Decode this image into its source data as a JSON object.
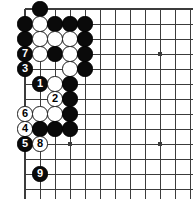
{
  "figure": {
    "board": {
      "type": "go-board",
      "visible_region": "upper-left corner partial board",
      "line_color": "#3c3c3c",
      "background_color": "#ffffff",
      "black_stone_color": "#0a0a0a",
      "white_stone_color": "#ffffff",
      "origin_x": 25,
      "origin_y": 9,
      "spacing": 15,
      "cols": 12,
      "rows": 13,
      "edge_left": true,
      "edge_top": true,
      "stone_radius": 7.6,
      "star_points": [
        {
          "col": 9,
          "row": 3
        },
        {
          "col": 9,
          "row": 9
        },
        {
          "col": 3,
          "row": 9
        }
      ]
    },
    "stones": [
      {
        "col": 1,
        "row": 0,
        "color": "black",
        "label": ""
      },
      {
        "col": 0,
        "row": 1,
        "color": "black",
        "label": ""
      },
      {
        "col": 1,
        "row": 1,
        "color": "white",
        "label": ""
      },
      {
        "col": 2,
        "row": 1,
        "color": "black",
        "label": ""
      },
      {
        "col": 3,
        "row": 1,
        "color": "black",
        "label": ""
      },
      {
        "col": 4,
        "row": 1,
        "color": "black",
        "label": ""
      },
      {
        "col": 0,
        "row": 2,
        "color": "black",
        "label": ""
      },
      {
        "col": 1,
        "row": 2,
        "color": "white",
        "label": ""
      },
      {
        "col": 2,
        "row": 2,
        "color": "white",
        "label": ""
      },
      {
        "col": 3,
        "row": 2,
        "color": "white",
        "label": ""
      },
      {
        "col": 4,
        "row": 2,
        "color": "black",
        "label": ""
      },
      {
        "col": 0,
        "row": 3,
        "color": "black",
        "label": "7"
      },
      {
        "col": 1,
        "row": 3,
        "color": "white",
        "label": ""
      },
      {
        "col": 2,
        "row": 3,
        "color": "black",
        "label": ""
      },
      {
        "col": 3,
        "row": 3,
        "color": "white",
        "label": ""
      },
      {
        "col": 4,
        "row": 3,
        "color": "black",
        "label": ""
      },
      {
        "col": 0,
        "row": 4,
        "color": "black",
        "label": "3"
      },
      {
        "col": 3,
        "row": 4,
        "color": "white",
        "label": ""
      },
      {
        "col": 4,
        "row": 4,
        "color": "black",
        "label": ""
      },
      {
        "col": 1,
        "row": 5,
        "color": "black",
        "label": "1"
      },
      {
        "col": 2,
        "row": 5,
        "color": "white",
        "label": ""
      },
      {
        "col": 3,
        "row": 5,
        "color": "black",
        "label": ""
      },
      {
        "col": 2,
        "row": 6,
        "color": "white",
        "label": "2"
      },
      {
        "col": 3,
        "row": 6,
        "color": "black",
        "label": ""
      },
      {
        "col": 0,
        "row": 7,
        "color": "white",
        "label": "6"
      },
      {
        "col": 1,
        "row": 7,
        "color": "white",
        "label": ""
      },
      {
        "col": 2,
        "row": 7,
        "color": "white",
        "label": ""
      },
      {
        "col": 3,
        "row": 7,
        "color": "black",
        "label": ""
      },
      {
        "col": 0,
        "row": 8,
        "color": "white",
        "label": "4"
      },
      {
        "col": 1,
        "row": 8,
        "color": "black",
        "label": ""
      },
      {
        "col": 2,
        "row": 8,
        "color": "black",
        "label": ""
      },
      {
        "col": 3,
        "row": 8,
        "color": "black",
        "label": ""
      },
      {
        "col": 0,
        "row": 9,
        "color": "black",
        "label": "5"
      },
      {
        "col": 1,
        "row": 9,
        "color": "white",
        "label": "8"
      },
      {
        "col": 1,
        "row": 11,
        "color": "black",
        "label": "9"
      }
    ],
    "move_sequence": [
      {
        "move": 1,
        "color": "black"
      },
      {
        "move": 2,
        "color": "white"
      },
      {
        "move": 3,
        "color": "black"
      },
      {
        "move": 4,
        "color": "white"
      },
      {
        "move": 5,
        "color": "black"
      },
      {
        "move": 6,
        "color": "white"
      },
      {
        "move": 7,
        "color": "black"
      },
      {
        "move": 8,
        "color": "white"
      },
      {
        "move": 9,
        "color": "black"
      }
    ]
  }
}
